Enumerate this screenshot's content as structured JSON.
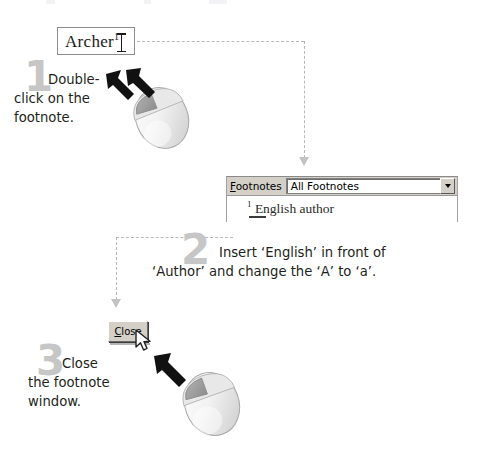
{
  "document": {
    "title": "Edit footnote instruction steps",
    "archer_text": "Archer",
    "archer_footnote_marker": "1"
  },
  "steps": [
    {
      "number": "1",
      "text_line_1": "Double-",
      "text_line_2": "click on the",
      "text_line_3": "footnote.",
      "action": "double-click",
      "mouse_arrows": 2
    },
    {
      "number": "2",
      "text_line_1": "Insert ‘English’ in front of",
      "text_line_2": "‘Author’ and change the ‘A’ to ‘a’.",
      "action": "type",
      "mouse_arrows": 0
    },
    {
      "number": "3",
      "text_line_1": "Close",
      "text_line_2": "the footnote",
      "text_line_3": "window.",
      "action": "click",
      "mouse_arrows": 1
    }
  ],
  "footnotes_pane": {
    "label": "Footnotes",
    "label_accelerator": "F",
    "combo_value": "All Footnotes",
    "combo_options": [
      "All Footnotes"
    ],
    "entry_marker": "1",
    "entry_text": "English author"
  },
  "close_button": {
    "label": "Close",
    "label_accelerator": "C"
  },
  "colors": {
    "step_number": "#c6c6c6",
    "body_text": "#231f20",
    "connector": "#b9b9b9",
    "dialog_face": "#d4d0c8",
    "mouse_button_highlight": "#9a9a9a"
  }
}
